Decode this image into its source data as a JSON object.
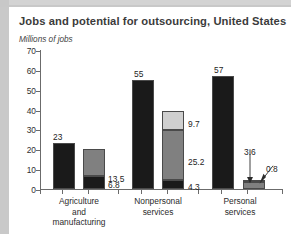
{
  "figure": {
    "title": "Jobs and potential for outsourcing, United States",
    "subtitle": "Millions of jobs"
  },
  "chart_data": {
    "type": "bar",
    "title": "Jobs and potential for outsourcing, United States",
    "subtitle": "Millions of jobs",
    "xlabel": "",
    "ylabel": "Millions of jobs",
    "ylim": [
      0,
      70
    ],
    "yticks": [
      0,
      10,
      20,
      30,
      40,
      50,
      60,
      70
    ],
    "ytick_labels": [
      "0",
      "10",
      "20",
      "30",
      "40",
      "50",
      "60",
      "70"
    ],
    "grid": false,
    "legend": "none",
    "stacked": true,
    "categories": [
      "Agriculture and manufacturing",
      "Nonpersonal services",
      "Personal services"
    ],
    "category_lines": [
      [
        "Agriculture",
        "and",
        "manufacturing"
      ],
      [
        "Nonpersonal",
        "services"
      ],
      [
        "Personal",
        "services"
      ]
    ],
    "groups": [
      {
        "category": "Agriculture and manufacturing",
        "bars": [
          {
            "name": "total-jobs",
            "segments": [
              {
                "label": "23",
                "value": 23,
                "color": "#1a1a1a",
                "shade": "black"
              }
            ]
          },
          {
            "name": "outsourcing-potential",
            "segments": [
              {
                "label": "6.8",
                "value": 6.8,
                "color": "#1a1a1a",
                "shade": "black"
              },
              {
                "label": "13.5",
                "value": 13.5,
                "color": "#808080",
                "shade": "medium-gray"
              }
            ]
          }
        ]
      },
      {
        "category": "Nonpersonal services",
        "bars": [
          {
            "name": "total-jobs",
            "segments": [
              {
                "label": "55",
                "value": 55,
                "color": "#1a1a1a",
                "shade": "black"
              }
            ]
          },
          {
            "name": "outsourcing-potential",
            "segments": [
              {
                "label": "4.3",
                "value": 4.3,
                "color": "#1a1a1a",
                "shade": "black"
              },
              {
                "label": "25.2",
                "value": 25.2,
                "color": "#808080",
                "shade": "medium-gray"
              },
              {
                "label": "9.7",
                "value": 9.7,
                "color": "#cfcfcf",
                "shade": "light-gray"
              }
            ]
          }
        ]
      },
      {
        "category": "Personal services",
        "bars": [
          {
            "name": "total-jobs",
            "segments": [
              {
                "label": "57",
                "value": 57,
                "color": "#1a1a1a",
                "shade": "black"
              }
            ]
          },
          {
            "name": "outsourcing-potential",
            "segments": [
              {
                "label": "3.6",
                "value": 3.6,
                "color": "#808080",
                "shade": "medium-gray"
              },
              {
                "label": "0.8",
                "value": 0.8,
                "color": "#cfcfcf",
                "shade": "light-gray"
              }
            ]
          }
        ]
      }
    ],
    "annotations": [
      {
        "label": "3.6",
        "target": "personal-services-potential-bar",
        "arrow": "down"
      },
      {
        "label": "0.8",
        "target": "personal-services-potential-top",
        "arrow": "diagonal-down-left"
      }
    ]
  },
  "colors": {
    "black": "#1a1a1a",
    "medium_gray": "#808080",
    "light_gray": "#cfcfcf",
    "axis": "#6b6b6b",
    "text": "#2b2b2b",
    "title": "#3b3b3b",
    "background": "#ffffff",
    "edge": "#c9c9c9"
  }
}
